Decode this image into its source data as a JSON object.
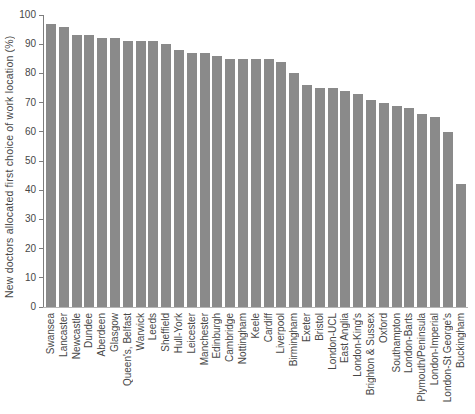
{
  "chart_data": {
    "type": "bar",
    "title": "",
    "xlabel": "",
    "ylabel": "New doctors allocated first choice of work location (%)",
    "ylim": [
      0,
      100
    ],
    "yticks": [
      0,
      10,
      20,
      30,
      40,
      50,
      60,
      70,
      80,
      90,
      100
    ],
    "grid": false,
    "legend_position": "none",
    "bar_color": "#8a8a8a",
    "axis_color": "#7d7d7d",
    "text_color": "#474747",
    "categories": [
      "Swansea",
      "Lancaster",
      "Newcastle",
      "Dundee",
      "Aberdeen",
      "Glasgow",
      "Queen's, Belfast",
      "Warwick",
      "Leeds",
      "Sheffield",
      "Hull-York",
      "Leicester",
      "Manchester",
      "Edinburgh",
      "Cambridge",
      "Nottingham",
      "Keele",
      "Cardiff",
      "Liverpool",
      "Birmingham",
      "Exeter",
      "Bristol",
      "London-UCL",
      "East Anglia",
      "London-King's",
      "Brighton & Sussex",
      "Oxford",
      "Southampton",
      "London-Barts",
      "Plymouth/Peninsula",
      "London-Imperial",
      "London-St George's",
      "Buckingham"
    ],
    "values": [
      97,
      96,
      93,
      93,
      92,
      92,
      91,
      91,
      91,
      90,
      88,
      87,
      87,
      86,
      85,
      85,
      85,
      85,
      84,
      80,
      76,
      75,
      75,
      74,
      73,
      71,
      70,
      69,
      68,
      66,
      65,
      60,
      42
    ]
  }
}
